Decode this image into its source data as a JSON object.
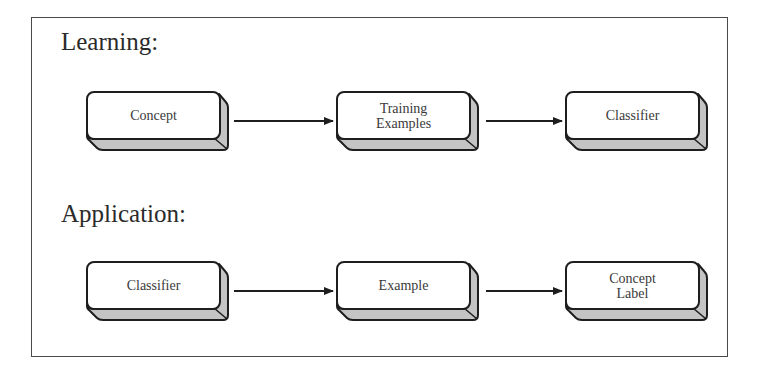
{
  "sections": [
    {
      "title": "Learning:",
      "nodes": [
        {
          "lines": [
            "Concept"
          ]
        },
        {
          "lines": [
            "Training",
            "Examples"
          ]
        },
        {
          "lines": [
            "Classifier"
          ]
        }
      ]
    },
    {
      "title": "Application:",
      "nodes": [
        {
          "lines": [
            "Classifier"
          ]
        },
        {
          "lines": [
            "Example"
          ]
        },
        {
          "lines": [
            "Concept",
            "Label"
          ]
        }
      ]
    }
  ],
  "labels": {
    "learning_title": "Learning:",
    "application_title": "Application:",
    "l_node1": "Concept",
    "l_node2_line1": "Training",
    "l_node2_line2": "Examples",
    "l_node3": "Classifier",
    "a_node1": "Classifier",
    "a_node2": "Example",
    "a_node3_line1": "Concept",
    "a_node3_line2": "Label"
  },
  "colors": {
    "box_face": "#ffffff",
    "box_extrusion": "#c4c4c4",
    "stroke": "#1e1e1e",
    "frame": "#4a4a4a"
  }
}
